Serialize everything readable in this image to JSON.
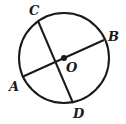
{
  "diagram": {
    "type": "geometry-circle",
    "stroke_color": "#1a1a1a",
    "background": "#ffffff",
    "circle": {
      "center_label": "O",
      "cx": 64,
      "cy": 58,
      "r": 45
    },
    "points": {
      "A": {
        "label": "A",
        "x": 22,
        "y": 77
      },
      "B": {
        "label": "B",
        "x": 104,
        "y": 40
      },
      "C": {
        "label": "C",
        "x": 38,
        "y": 21
      },
      "D": {
        "label": "D",
        "x": 73,
        "y": 103
      },
      "O": {
        "label": "O",
        "x": 64,
        "y": 58
      }
    },
    "segments": [
      {
        "name": "AB",
        "from": "A",
        "to": "B",
        "kind": "diameter"
      },
      {
        "name": "CD",
        "from": "C",
        "to": "D",
        "kind": "chord"
      }
    ],
    "labels": {
      "A": "A",
      "B": "B",
      "C": "C",
      "D": "D",
      "O": "O"
    }
  }
}
